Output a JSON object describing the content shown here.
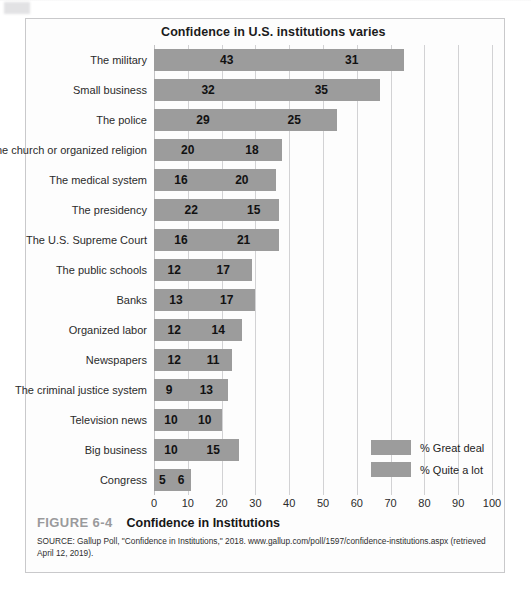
{
  "figure": {
    "number": "FIGURE 6-4",
    "title": "Confidence in Institutions",
    "source": "SOURCE: Gallup Poll, \"Confidence in Institutions,\" 2018. www.gallup.com/poll/1597/confidence-institutions.aspx (retrieved April 12, 2019)."
  },
  "chart_data": {
    "type": "bar",
    "orientation": "horizontal",
    "stacked": true,
    "title": "Confidence in U.S. institutions varies",
    "xlabel": "",
    "ylabel": "",
    "xlim": [
      0,
      100
    ],
    "xticks": [
      0,
      10,
      20,
      30,
      40,
      50,
      60,
      70,
      80,
      90,
      100
    ],
    "grid": true,
    "grid_axis": "x",
    "legend_position": "bottom-right",
    "bar_color": "#9c9c9c",
    "categories": [
      "The military",
      "Small business",
      "The police",
      "The church or organized religion",
      "The medical system",
      "The presidency",
      "The U.S. Supreme Court",
      "The public schools",
      "Banks",
      "Organized labor",
      "Newspapers",
      "The criminal justice system",
      "Television news",
      "Big business",
      "Congress"
    ],
    "series": [
      {
        "name": "% Great deal",
        "color": "#9c9c9c",
        "values": [
          43,
          32,
          29,
          20,
          16,
          22,
          16,
          12,
          13,
          12,
          12,
          9,
          10,
          10,
          5
        ]
      },
      {
        "name": "% Quite a lot",
        "color": "#9c9c9c",
        "values": [
          31,
          35,
          25,
          18,
          20,
          15,
          21,
          17,
          17,
          14,
          11,
          13,
          10,
          15,
          6
        ]
      }
    ],
    "totals": [
      74,
      67,
      54,
      38,
      36,
      37,
      37,
      29,
      30,
      26,
      23,
      22,
      20,
      25,
      11
    ]
  }
}
